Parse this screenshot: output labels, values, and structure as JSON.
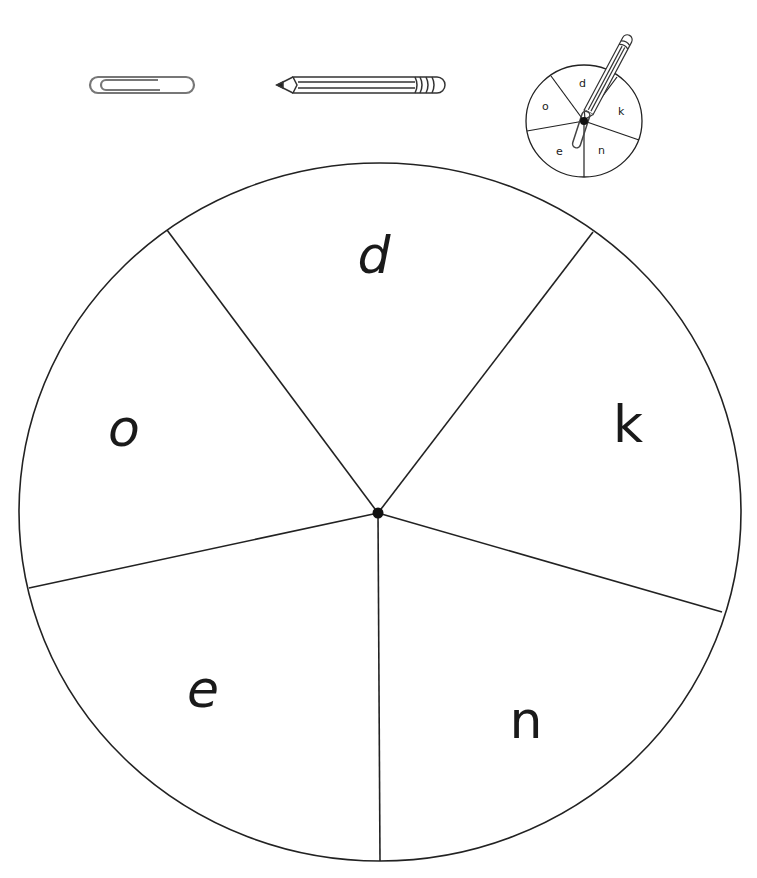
{
  "header_icons": {
    "paperclip": "paperclip-icon",
    "pencil": "pencil-icon",
    "example_spinner": "example-spinner-icon"
  },
  "spinner": {
    "segments": [
      {
        "letter": "d",
        "position": "top"
      },
      {
        "letter": "k",
        "position": "right"
      },
      {
        "letter": "n",
        "position": "bottom-right"
      },
      {
        "letter": "e",
        "position": "bottom-left"
      },
      {
        "letter": "o",
        "position": "left"
      }
    ]
  },
  "example_spinner": {
    "letters": [
      "d",
      "k",
      "n",
      "e",
      "o"
    ]
  },
  "colors": {
    "line": "#1a1a1a",
    "background": "#ffffff",
    "icon_gray": "#777777"
  }
}
